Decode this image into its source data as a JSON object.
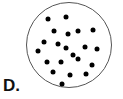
{
  "figure": {
    "label": "D.",
    "colors": {
      "background": "#ffffff",
      "circle_stroke": "#555555",
      "dot_fill": "#000000",
      "label_color": "#111111"
    },
    "circle": {
      "cx": 69,
      "cy": 45,
      "r": 42.5,
      "stroke_width": 1
    },
    "dot_radius": 2.5,
    "dot_count": 21,
    "dots": [
      {
        "x": 48,
        "y": 19
      },
      {
        "x": 66,
        "y": 17
      },
      {
        "x": 54,
        "y": 31
      },
      {
        "x": 68,
        "y": 34
      },
      {
        "x": 78,
        "y": 31
      },
      {
        "x": 93,
        "y": 30
      },
      {
        "x": 44,
        "y": 42
      },
      {
        "x": 58,
        "y": 44
      },
      {
        "x": 66,
        "y": 48
      },
      {
        "x": 85,
        "y": 47
      },
      {
        "x": 97,
        "y": 49
      },
      {
        "x": 38,
        "y": 51
      },
      {
        "x": 73,
        "y": 55
      },
      {
        "x": 47,
        "y": 62
      },
      {
        "x": 61,
        "y": 62
      },
      {
        "x": 78,
        "y": 59
      },
      {
        "x": 92,
        "y": 65
      },
      {
        "x": 53,
        "y": 72
      },
      {
        "x": 70,
        "y": 75
      },
      {
        "x": 86,
        "y": 74
      },
      {
        "x": 62,
        "y": 84
      }
    ]
  }
}
